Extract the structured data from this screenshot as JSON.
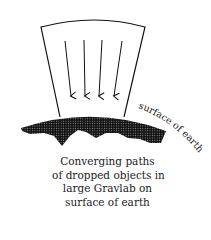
{
  "diagram": {
    "title": "Converging paths of dropped objects in large Gravlab on surface of earth",
    "earth_label": "surface of earth",
    "caption": {
      "lines": [
        "Converging paths",
        "of dropped  objects in",
        "large Gravlab on",
        "surface of earth"
      ]
    },
    "elements": {
      "lab_frame": "tapered box (Gravlab) with curved top",
      "arrows": 4,
      "earth_surface": "dotted/hatched curved band representing the earth"
    },
    "colors": {
      "line": "#111111",
      "earth_fill": "#2a2a2a",
      "background": "#ffffff"
    }
  }
}
